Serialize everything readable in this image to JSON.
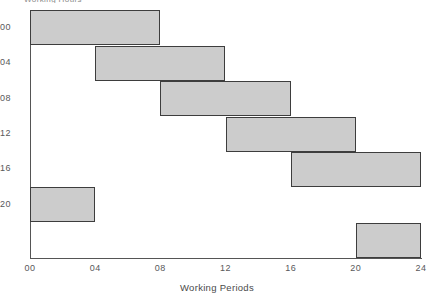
{
  "chart_data": {
    "type": "bar",
    "orientation": "horizontal",
    "title": "",
    "xlabel": "Working Periods",
    "ylabel": "",
    "xlim": [
      0,
      24
    ],
    "xticks": [
      "00",
      "04",
      "08",
      "12",
      "16",
      "20",
      "24"
    ],
    "xtick_values": [
      0,
      4,
      8,
      12,
      16,
      20,
      24
    ],
    "categories": [
      "00",
      "04",
      "08",
      "12",
      "16",
      "20",
      ""
    ],
    "grid": false,
    "legend": null,
    "bar_fill_color": "#cccccc",
    "bar_edge_color": "#3d3d3d",
    "background_color": "#ffffff",
    "bars": [
      {
        "label": "00",
        "start": 0,
        "end": 8,
        "duration": 8
      },
      {
        "label": "04",
        "start": 4,
        "end": 12,
        "duration": 8
      },
      {
        "label": "08",
        "start": 8,
        "end": 16,
        "duration": 8
      },
      {
        "label": "12",
        "start": 12,
        "end": 20,
        "duration": 8
      },
      {
        "label": "16",
        "start": 16,
        "end": 24,
        "duration": 8
      },
      {
        "label": "20",
        "start": 0,
        "end": 4,
        "duration": 4
      },
      {
        "label": "",
        "start": 20,
        "end": 24,
        "duration": 4
      }
    ]
  },
  "axis": {
    "top_clipped_label": "Working Hours"
  }
}
